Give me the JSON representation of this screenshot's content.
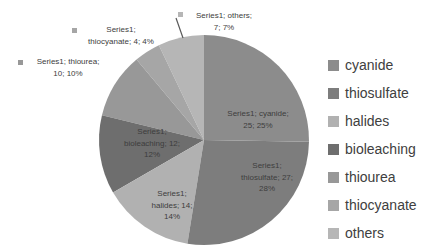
{
  "chart_data": {
    "type": "pie",
    "series_name": "Series1",
    "categories": [
      "cyanide",
      "thiosulfate",
      "halides",
      "bioleaching",
      "thiourea",
      "thiocyanate",
      "others"
    ],
    "values": [
      25,
      27,
      14,
      12,
      10,
      4,
      7
    ],
    "displayed_percents": [
      "25%",
      "28%",
      "14%",
      "12%",
      "10%",
      "4%",
      "7%"
    ],
    "colors": [
      "#8c8c8c",
      "#7d7d7d",
      "#b1b1b1",
      "#6e6e6e",
      "#989898",
      "#a6a6a6",
      "#b6b6b6"
    ],
    "start_angle_deg": 0,
    "direction": "clockwise",
    "legend_position": "right",
    "grid": false,
    "data_labels": {
      "cyanide": [
        "Series1; cyanide;",
        "25; 25%"
      ],
      "thiosulfate": [
        "Series1;",
        "thiosulfate; 27;",
        "28%"
      ],
      "halides": [
        "Series1;",
        "halides; 14;",
        "14%"
      ],
      "bioleaching": [
        "Series1;",
        "bioleaching; 12;",
        "12%"
      ],
      "thiourea": [
        "Series1; thiourea;",
        "10; 10%"
      ],
      "thiocyanate": [
        "Series1;",
        "thiocyanate; 4; 4%"
      ],
      "others": [
        "Series1; others;",
        "7; 7%"
      ]
    }
  },
  "legend": {
    "items": [
      {
        "label": "cyanide",
        "color": "#8c8c8c"
      },
      {
        "label": "thiosulfate",
        "color": "#7d7d7d"
      },
      {
        "label": "halides",
        "color": "#b1b1b1"
      },
      {
        "label": "bioleaching",
        "color": "#6e6e6e"
      },
      {
        "label": "thiourea",
        "color": "#989898"
      },
      {
        "label": "thiocyanate",
        "color": "#a6a6a6"
      },
      {
        "label": "others",
        "color": "#b6b6b6"
      }
    ]
  },
  "styles": {
    "label_text_color": "#3d3d3d",
    "legend_text_color": "#404040",
    "leader_line_color": "#595959",
    "background": "#ffffff"
  }
}
